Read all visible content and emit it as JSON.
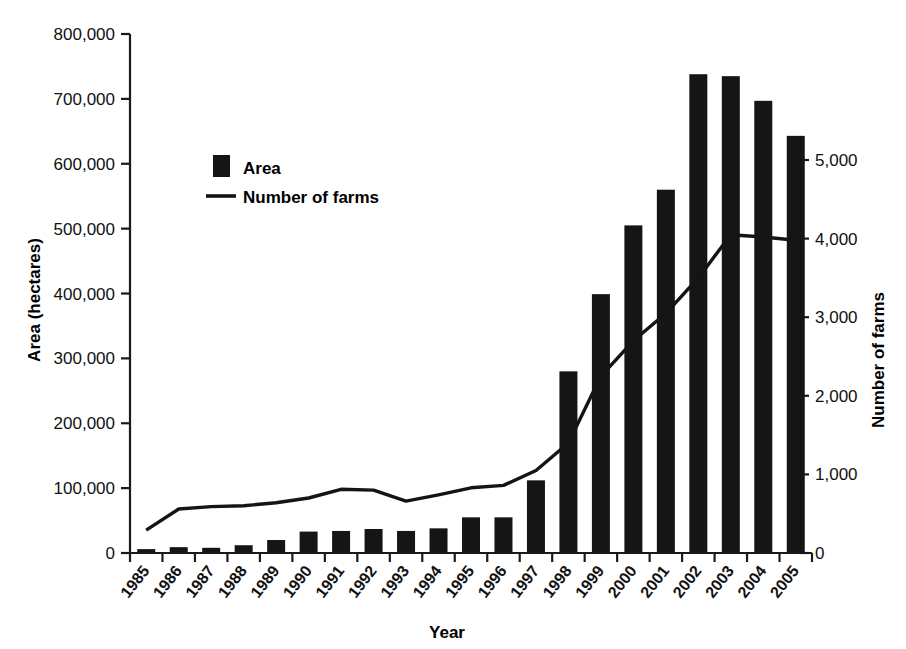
{
  "chart_data": {
    "type": "bar",
    "title": "",
    "subtitle": "",
    "xlabel": "Year",
    "ylabel": "Area (hectares)",
    "y2label": "Number of farms",
    "categories": [
      "1985",
      "1986",
      "1987",
      "1988",
      "1989",
      "1990",
      "1991",
      "1992",
      "1993",
      "1994",
      "1995",
      "1996",
      "1997",
      "1998",
      "1999",
      "2000",
      "2001",
      "2002",
      "2003",
      "2004",
      "2005"
    ],
    "ylim": [
      0,
      800000
    ],
    "y2lim": [
      0,
      5000
    ],
    "yticks": [
      0,
      100000,
      200000,
      300000,
      400000,
      500000,
      600000,
      700000,
      800000
    ],
    "ytick_labels": [
      "0",
      "100,000",
      "200,000",
      "300,000",
      "400,000",
      "500,000",
      "600,000",
      "700,000",
      "800,000"
    ],
    "y2ticks": [
      0,
      1000,
      2000,
      3000,
      4000,
      5000
    ],
    "y2tick_labels": [
      "0",
      "1,000",
      "2,000",
      "3,000",
      "4,000",
      "5,000"
    ],
    "grid": false,
    "legend_position": "upper-left-inside",
    "series": [
      {
        "name": "Area",
        "type": "bar",
        "axis": "left",
        "unit": "hectares",
        "color": "#151515",
        "values": [
          6000,
          9000,
          8000,
          12000,
          20000,
          33000,
          34000,
          37000,
          34000,
          38000,
          55000,
          55000,
          112000,
          280000,
          399000,
          505000,
          560000,
          738000,
          735000,
          697000,
          643000
        ]
      },
      {
        "name": "Number of farms",
        "type": "line",
        "axis": "right",
        "unit": "farms",
        "color": "#141414",
        "values": [
          290,
          560,
          590,
          600,
          640,
          700,
          810,
          800,
          660,
          740,
          830,
          860,
          1050,
          1400,
          2250,
          2700,
          3050,
          3500,
          4050,
          4020,
          3980
        ]
      }
    ]
  },
  "legend": {
    "items": [
      {
        "label": "Area",
        "marker": "square"
      },
      {
        "label": "Number of farms",
        "marker": "line"
      }
    ]
  }
}
